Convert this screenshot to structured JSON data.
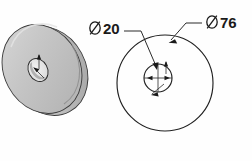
{
  "drawing": {
    "title": "Washer Technical Drawing",
    "background_color": "#fefefe",
    "line_color": "#202020",
    "views": [
      {
        "id": "isometric-view",
        "name": "Isometric Pictorial View",
        "type": "isometric",
        "shading": {
          "top_face_color": "#c9c9c9",
          "front_face_color": "#bdbdbd",
          "rim_color": "#d2d2d2",
          "hole_color": "#e8e8e8",
          "outline_color": "#3a3a3a"
        },
        "center": {
          "x": 70,
          "y": 196
        },
        "annotations": []
      },
      {
        "id": "front-view",
        "name": "Front Orthographic View",
        "type": "orthographic",
        "outer_circle": {
          "cx": 165,
          "cy": 83,
          "r": 48
        },
        "inner_circle": {
          "cx": 158,
          "cy": 78,
          "r": 14
        },
        "centerline": true
      }
    ],
    "dimensions": [
      {
        "id": "inner-diameter",
        "symbol": "Ø",
        "value": "20",
        "label": "Ø20",
        "text_x": 89,
        "text_y": 34,
        "feature": "center hole diameter",
        "leader_target": "inner_circle"
      },
      {
        "id": "outer-diameter",
        "symbol": "Ø",
        "value": "76",
        "label": "Ø76",
        "text_x": 206,
        "text_y": 28,
        "feature": "outside diameter",
        "leader_target": "outer_circle"
      }
    ]
  }
}
